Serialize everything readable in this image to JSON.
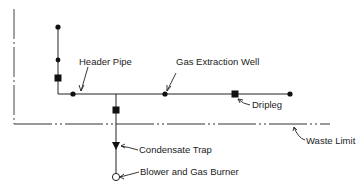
{
  "diagram": {
    "type": "landfill gas extraction system schematic",
    "labels": {
      "header_pipe": "Header Pipe",
      "gas_extraction_well": "Gas Extraction Well",
      "dripleg": "Dripleg",
      "waste_limit": "Waste Limit",
      "condensate_trap": "Condensate Trap",
      "blower_and_gas_burner": "Blower and Gas Burner"
    },
    "colors": {
      "line": "#222222",
      "background": "#ffffff"
    }
  }
}
